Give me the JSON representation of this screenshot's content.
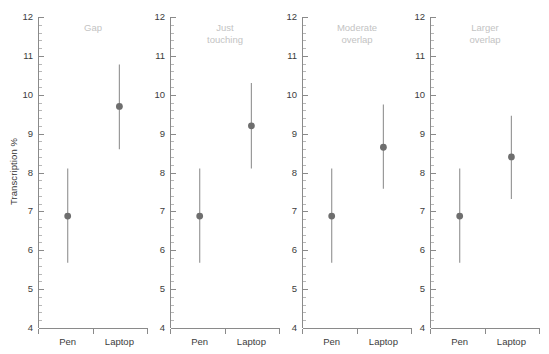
{
  "chart_data": {
    "type": "scatter",
    "title": "",
    "xlabel": "",
    "ylabel": "Transcription %",
    "ylim": [
      4,
      12
    ],
    "yticks": [
      4,
      5,
      6,
      7,
      8,
      9,
      10,
      11,
      12
    ],
    "ytick_labels": [
      "4",
      "5",
      "6",
      "7",
      "8",
      "9",
      "10",
      "11",
      "12"
    ],
    "minor_tick_step": 0.2,
    "grid": false,
    "legend": "none",
    "categories": [
      "Pen",
      "Laptop"
    ],
    "marker": "filled-circle",
    "errorbar_style": "vertical-line-confidence-interval",
    "colors": {
      "marker": "#6e6e6e",
      "errorbar": "#9a9a9a",
      "axis": "#8a8a8a",
      "tick_text": "#3c3c3c",
      "panel_title": "#c3c3c3",
      "background": "#ffffff"
    },
    "panels": [
      {
        "title": "Gap",
        "points": [
          {
            "category": "Pen",
            "mean": 6.88,
            "low": 5.68,
            "high": 8.1
          },
          {
            "category": "Laptop",
            "mean": 9.7,
            "low": 8.6,
            "high": 10.78
          }
        ]
      },
      {
        "title": "Just\ntouching",
        "points": [
          {
            "category": "Pen",
            "mean": 6.88,
            "low": 5.68,
            "high": 8.1
          },
          {
            "category": "Laptop",
            "mean": 9.2,
            "low": 8.1,
            "high": 10.3
          }
        ]
      },
      {
        "title": "Moderate\noverlap",
        "points": [
          {
            "category": "Pen",
            "mean": 6.88,
            "low": 5.68,
            "high": 8.1
          },
          {
            "category": "Laptop",
            "mean": 8.65,
            "low": 7.58,
            "high": 9.75
          }
        ]
      },
      {
        "title": "Larger\noverlap",
        "points": [
          {
            "category": "Pen",
            "mean": 6.88,
            "low": 5.68,
            "high": 8.1
          },
          {
            "category": "Laptop",
            "mean": 8.4,
            "low": 7.32,
            "high": 9.46
          }
        ]
      }
    ]
  },
  "axis": {
    "y_label": "Transcription %",
    "y_tick_labels": [
      "12",
      "11",
      "10",
      "9",
      "8",
      "7",
      "6",
      "5",
      "4"
    ],
    "x_tick_labels": [
      "Pen",
      "Laptop"
    ]
  },
  "panel_titles": {
    "p0": "Gap",
    "p1": "Just\ntouching",
    "p2": "Moderate\noverlap",
    "p3": "Larger\noverlap"
  }
}
